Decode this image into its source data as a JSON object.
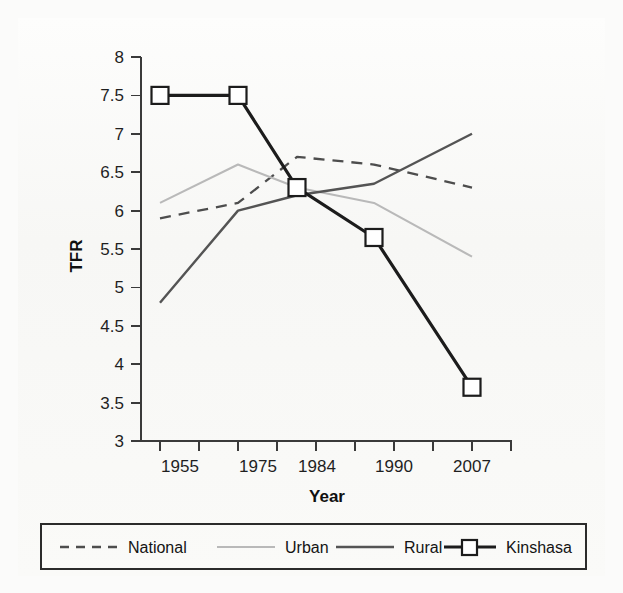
{
  "chart_data": {
    "type": "line",
    "title": "",
    "xlabel": "Year",
    "ylabel": "TFR",
    "x_categories": [
      "1955",
      "1975",
      "1984",
      "1990",
      "2007"
    ],
    "x_tick_count": 10,
    "x_tick_labels": [
      "1955",
      "1975",
      "1984",
      "1990",
      "2007"
    ],
    "ylim": [
      3,
      8
    ],
    "y_ticks": [
      "3",
      "3.5",
      "4",
      "4.5",
      "5",
      "5.5",
      "6",
      "6.5",
      "7",
      "7.5",
      "8"
    ],
    "grid": false,
    "legend_position": "bottom",
    "series": [
      {
        "name": "National",
        "style": "dashed",
        "color": "#4d4d4d",
        "values": [
          5.9,
          6.1,
          6.7,
          6.6,
          6.3
        ]
      },
      {
        "name": "Urban",
        "style": "solid-light",
        "color": "#b9b9b9",
        "values": [
          6.1,
          6.6,
          6.3,
          6.1,
          5.4
        ]
      },
      {
        "name": "Rural",
        "style": "solid",
        "color": "#545454",
        "values": [
          4.8,
          6.0,
          6.2,
          6.35,
          7.0
        ]
      },
      {
        "name": "Kinshasa",
        "style": "solid-marker",
        "marker": "square",
        "color": "#1c1c1c",
        "values": [
          7.5,
          7.5,
          6.3,
          5.65,
          3.7
        ]
      }
    ]
  },
  "axes": {
    "y_label": "TFR",
    "x_label": "Year",
    "y_tick_labels": [
      "8",
      "7.5",
      "7",
      "6.5",
      "6",
      "5.5",
      "5",
      "4.5",
      "4",
      "3.5",
      "3"
    ],
    "x_tick_labels": [
      "1955",
      "1975",
      "1984",
      "1990",
      "2007"
    ]
  },
  "legend": {
    "items": [
      {
        "label": "National"
      },
      {
        "label": "Urban"
      },
      {
        "label": "Rural"
      },
      {
        "label": "Kinshasa"
      }
    ]
  },
  "colors": {
    "national": "#4d4d4d",
    "urban": "#b9b9b9",
    "rural": "#545454",
    "kinshasa": "#1c1c1c",
    "axis": "#3a3a3a",
    "background": "#fbfbfa"
  }
}
